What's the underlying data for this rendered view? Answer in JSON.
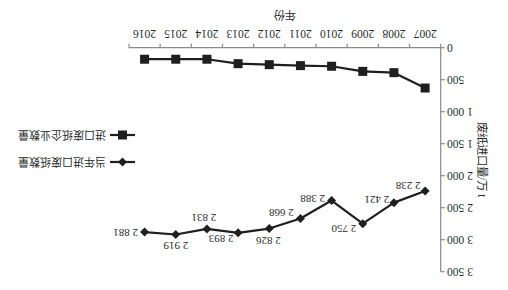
{
  "chart_data": {
    "type": "line",
    "title": "",
    "xlabel": "年份",
    "ylabel": "废纸进口量/万 t",
    "categories": [
      "2007",
      "2008",
      "2009",
      "2010",
      "2011",
      "2012",
      "2013",
      "2014",
      "2015",
      "2016"
    ],
    "ylim": [
      0,
      3500
    ],
    "yticks": [
      0,
      500,
      1000,
      1500,
      2000,
      2500,
      3000,
      3500
    ],
    "ytick_labels": [
      "0",
      "500",
      "1 000",
      "1 500",
      "2 000",
      "2 500",
      "3 000",
      "3 500"
    ],
    "grid": false,
    "legend_position": "right",
    "display_rotation_deg": 180,
    "series": [
      {
        "name": "当年进口废纸数量",
        "marker": "diamond",
        "color": "#1f1f1f",
        "values": [
          2238,
          2421,
          2750,
          2388,
          2668,
          2826,
          2893,
          2831,
          2919,
          2881
        ],
        "data_labels": [
          "2 238",
          "2 421",
          "2 750",
          "2 388",
          "2 668",
          "2 826",
          "2 893",
          "2 831",
          "2 919",
          "2 881"
        ]
      },
      {
        "name": "进口废纸企业数量",
        "marker": "square",
        "color": "#1f1f1f",
        "values": [
          630,
          390,
          370,
          290,
          280,
          265,
          250,
          180,
          180,
          180
        ]
      }
    ]
  }
}
